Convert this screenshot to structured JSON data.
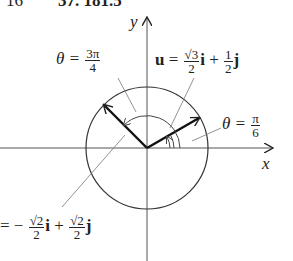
{
  "header_fragment": {
    "left": "16",
    "right": "37. 181.5"
  },
  "axes": {
    "x_label": "x",
    "y_label": "y"
  },
  "labels": {
    "theta_3pi4": {
      "lhs": "θ =",
      "num": "3π",
      "den": "4"
    },
    "theta_pi6": {
      "lhs": "θ =",
      "num": "π",
      "den": "6"
    },
    "u_vector": {
      "lhs": "u",
      "eq": "=",
      "c1_num": "√3",
      "c1_den": "2",
      "i": "i",
      "plus": "+",
      "c2_num": "1",
      "c2_den": "2",
      "j": "j"
    },
    "v_vector": {
      "eq": "= −",
      "c1_num": "√2",
      "c1_den": "2",
      "i": "i",
      "plus": "+",
      "c2_num": "√2",
      "c2_den": "2",
      "j": "j"
    }
  },
  "geometry": {
    "origin": [
      147,
      148
    ],
    "radius": 61,
    "u_angle_deg": 30,
    "v_angle_deg": 135
  }
}
